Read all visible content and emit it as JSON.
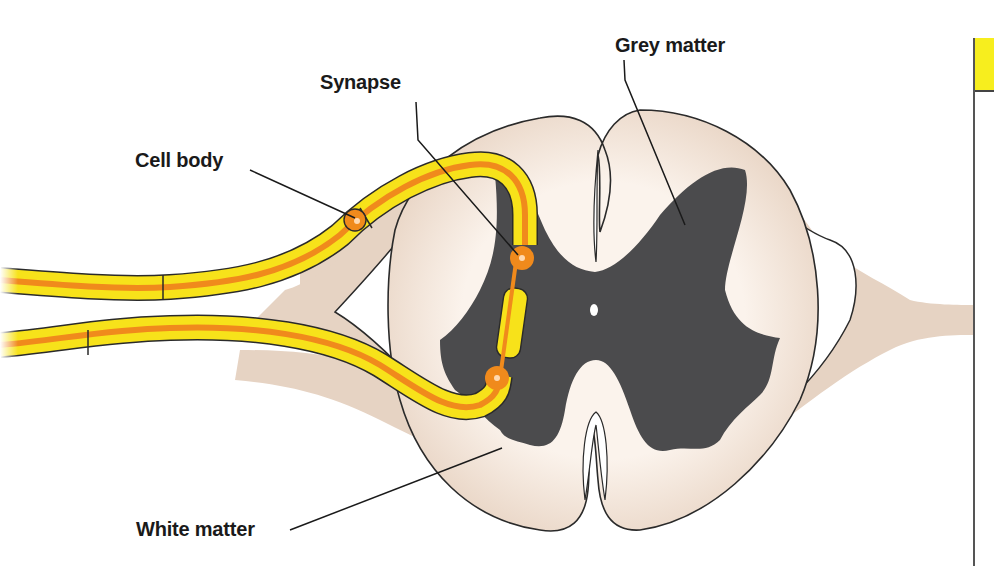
{
  "diagram": {
    "labels": {
      "synapse": "Synapse",
      "grey_matter": "Grey matter",
      "cell_body": "Cell body",
      "white_matter": "White matter"
    },
    "colors": {
      "white_matter": "#ead8c8",
      "white_matter_inner": "#fbf3ec",
      "grey_matter": "#4b4b4d",
      "nerve_outer": "#f7e21a",
      "nerve_core": "#f08a1c",
      "outline": "#2a2a2a",
      "side_panel_header": "#f7ee1e"
    }
  }
}
